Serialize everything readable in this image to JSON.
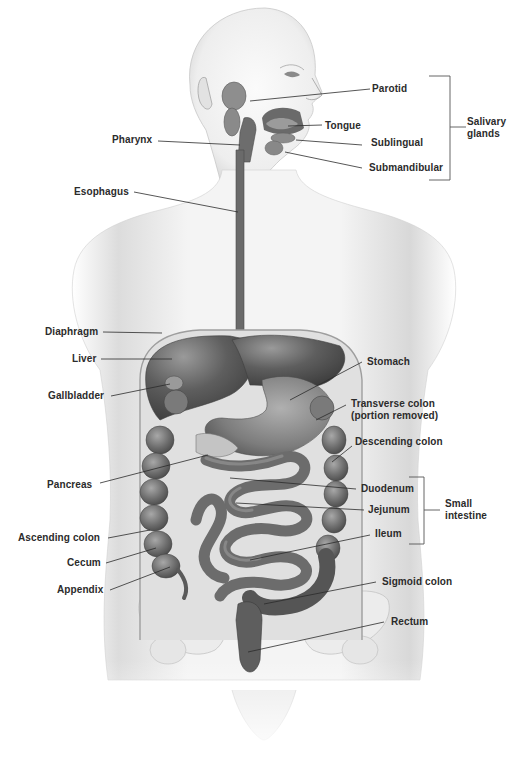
{
  "figure": {
    "type": "anatomical-diagram",
    "colors": {
      "background": "#ffffff",
      "skin_light": "#f1f1f1",
      "skin_shade": "#cfcfcf",
      "organ_dark": "#5a5a5a",
      "organ_mid": "#7a7a7a",
      "organ_light": "#9a9a9a",
      "label_text": "#2b2b2b",
      "leader_line": "#2b2b2b"
    }
  },
  "labels": {
    "parotid": "Parotid",
    "tongue": "Tongue",
    "sublingual": "Sublingual",
    "submandibular": "Submandibular",
    "salivary_glands_line1": "Salivary",
    "salivary_glands_line2": "glands",
    "pharynx": "Pharynx",
    "esophagus": "Esophagus",
    "diaphragm": "Diaphragm",
    "liver": "Liver",
    "gallbladder": "Gallbladder",
    "stomach": "Stomach",
    "transverse_colon_line1": "Transverse colon",
    "transverse_colon_line2": "(portion removed)",
    "descending_colon": "Descending colon",
    "pancreas": "Pancreas",
    "duodenum": "Duodenum",
    "jejunum": "Jejunum",
    "ileum": "Ileum",
    "small_intestine_line1": "Small",
    "small_intestine_line2": "intestine",
    "ascending_colon": "Ascending colon",
    "cecum": "Cecum",
    "appendix": "Appendix",
    "sigmoid_colon": "Sigmoid colon",
    "rectum": "Rectum"
  },
  "groups": [
    {
      "name": "Salivary glands",
      "members": [
        "Parotid",
        "Sublingual",
        "Submandibular"
      ]
    },
    {
      "name": "Small intestine",
      "members": [
        "Duodenum",
        "Jejunum",
        "Ileum"
      ]
    }
  ]
}
